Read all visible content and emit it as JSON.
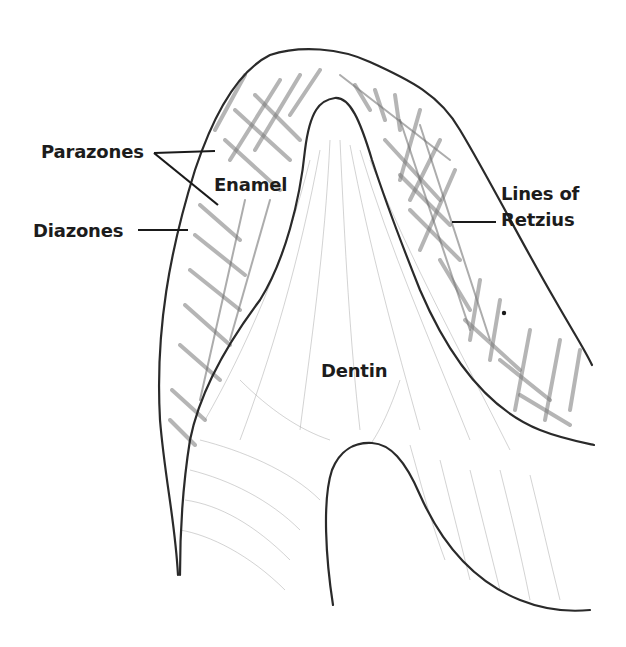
{
  "figure": {
    "labels": {
      "parazones": "Parazones",
      "enamel": "Enamel",
      "diazones": "Diazones",
      "lines_of_retzius_line1": "Lines of",
      "lines_of_retzius_line2": "Retzius",
      "dentin": "Dentin"
    },
    "colors": {
      "background": "#ffffff",
      "ink": "#1c1c1c",
      "shading": "#7a7a7a"
    }
  }
}
